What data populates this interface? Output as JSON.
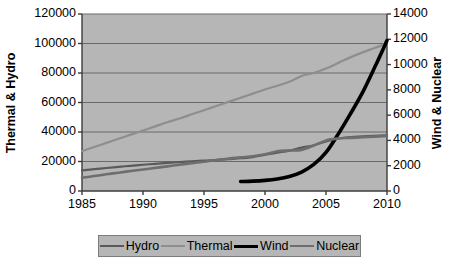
{
  "chart_data": {
    "type": "line",
    "title": "",
    "xlabel": "",
    "x": [
      1985,
      1986,
      1987,
      1988,
      1989,
      1990,
      1991,
      1992,
      1993,
      1994,
      1995,
      1996,
      1997,
      1998,
      1999,
      2000,
      2001,
      2002,
      2003,
      2004,
      2005,
      2006,
      2007,
      2008,
      2009,
      2010
    ],
    "xlim": [
      1985,
      2010
    ],
    "xticks": [
      1985,
      1990,
      1995,
      2000,
      2005,
      2010
    ],
    "xtick_labels": [
      "1985",
      "1990",
      "1995",
      "2000",
      "2005",
      "2010"
    ],
    "grid": true,
    "legend_position": "bottom",
    "axes": [
      {
        "id": "left",
        "label": "Thermal & Hydro",
        "lim": [
          0,
          120000
        ],
        "ticks": [
          0,
          20000,
          40000,
          60000,
          80000,
          100000,
          120000
        ],
        "tick_labels": [
          "0",
          "20000",
          "40000",
          "60000",
          "80000",
          "100000",
          "120000"
        ]
      },
      {
        "id": "right",
        "label": "Wind & Nuclear",
        "lim": [
          0,
          14000
        ],
        "ticks": [
          0,
          2000,
          4000,
          6000,
          8000,
          10000,
          12000,
          14000
        ],
        "tick_labels": [
          "0",
          "2000",
          "4000",
          "6000",
          "8000",
          "10000",
          "12000",
          "14000"
        ]
      }
    ],
    "series": [
      {
        "name": "Hydro",
        "axis": "left",
        "color": "#5a5a5a",
        "width": 2.2,
        "x": [
          1985,
          1986,
          1987,
          1988,
          1989,
          1990,
          1991,
          1992,
          1993,
          1994,
          1995,
          1996,
          1997,
          1998,
          1999,
          2000,
          2001,
          2002,
          2003,
          2004,
          2005,
          2006,
          2007,
          2008,
          2009,
          2010
        ],
        "values": [
          14000,
          14800,
          15600,
          16400,
          17100,
          17800,
          18400,
          19000,
          19600,
          20100,
          20600,
          21000,
          21600,
          22200,
          23000,
          24600,
          26000,
          27400,
          29400,
          31000,
          33600,
          35600,
          36600,
          37000,
          37400,
          37800
        ]
      },
      {
        "name": "Thermal",
        "axis": "left",
        "color": "#8e8e8e",
        "width": 2.2,
        "x": [
          1985,
          1986,
          1987,
          1988,
          1989,
          1990,
          1991,
          1992,
          1993,
          1994,
          1995,
          1996,
          1997,
          1998,
          1999,
          2000,
          2001,
          2002,
          2003,
          2004,
          2005,
          2006,
          2007,
          2008,
          2009,
          2010
        ],
        "values": [
          27000,
          29800,
          32600,
          35400,
          38200,
          41000,
          43800,
          46600,
          49200,
          52000,
          54800,
          57600,
          60400,
          63200,
          66000,
          68800,
          71400,
          74000,
          78000,
          80000,
          83000,
          86800,
          90600,
          94000,
          97000,
          100200
        ]
      },
      {
        "name": "Wind",
        "axis": "right",
        "color": "#000000",
        "width": 3.6,
        "x": [
          1998,
          1999,
          2000,
          2001,
          2002,
          2003,
          2004,
          2005,
          2006,
          2007,
          2008,
          2009,
          2010
        ],
        "values": [
          750,
          780,
          840,
          950,
          1150,
          1500,
          2100,
          3050,
          4500,
          6100,
          7800,
          9800,
          11900
        ]
      },
      {
        "name": "Nuclear",
        "axis": "right",
        "color": "#6e6e6e",
        "width": 2.6,
        "x": [
          1985,
          1986,
          1987,
          1988,
          1989,
          1990,
          1991,
          1992,
          1993,
          1994,
          1995,
          1996,
          1997,
          1998,
          1999,
          2000,
          2001,
          2002,
          2003,
          2004,
          2005,
          2006,
          2007,
          2008,
          2009,
          2010
        ],
        "values": [
          1050,
          1180,
          1320,
          1450,
          1580,
          1700,
          1830,
          1950,
          2080,
          2200,
          2320,
          2450,
          2560,
          2660,
          2740,
          2900,
          3150,
          3200,
          3250,
          3600,
          4000,
          4150,
          4200,
          4250,
          4300,
          4350
        ]
      }
    ]
  },
  "legend": {
    "entries": [
      {
        "label": "Hydro"
      },
      {
        "label": "Thermal"
      },
      {
        "label": "Wind"
      },
      {
        "label": "Nuclear"
      }
    ]
  },
  "colors": {
    "plot_background": "#b6b6b6",
    "grid": "#6a6a6a",
    "frame": "#3c3c3c",
    "page_background": "#ffffff"
  }
}
